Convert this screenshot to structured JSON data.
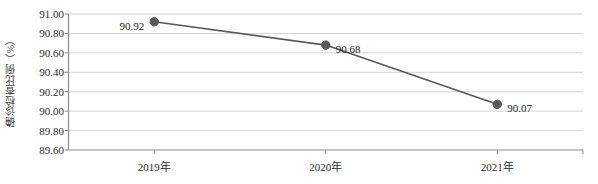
{
  "chart_data": {
    "type": "line",
    "title": "",
    "subtitle": "",
    "xlabel": "",
    "ylabel": "确诊检查比例（%）",
    "categories": [
      "2019年",
      "2020年",
      "2021年"
    ],
    "values": [
      90.92,
      90.68,
      90.07
    ],
    "point_labels": [
      "90.92",
      "90.68",
      "90.07"
    ],
    "ylim": [
      89.6,
      91.0
    ],
    "ytick_step": 0.2,
    "ytick_labels": [
      "91.00",
      "90.80",
      "90.60",
      "90.40",
      "90.20",
      "90.00",
      "89.80",
      "89.60"
    ],
    "ytick_values": [
      91.0,
      90.8,
      90.6,
      90.4,
      90.2,
      90.0,
      89.8,
      89.6
    ],
    "grid": true,
    "grid_axis": "y",
    "legend": false,
    "legend_position": "none",
    "series": [
      {
        "name": "确诊检查比例",
        "values": [
          90.92,
          90.68,
          90.07
        ]
      }
    ],
    "colors": {
      "line": "#595959",
      "marker": "#595959",
      "grid": "#d4d4d4",
      "axis": "#8c8c8c",
      "text": "#1c1c1c",
      "background": "#ffffff"
    },
    "label_offsets": [
      "left",
      "right",
      "right"
    ]
  }
}
